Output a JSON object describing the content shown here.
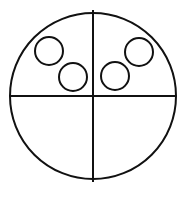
{
  "diagram": {
    "width": 189,
    "height": 199,
    "background": "#ffffff",
    "stroke_color": "#111111",
    "outer_circle": {
      "cx": 93,
      "cy": 96,
      "r": 83,
      "stroke_width": 2
    },
    "dividers": {
      "vertical": {
        "x1": 93,
        "y1": 10,
        "x2": 93,
        "y2": 182,
        "stroke_width": 2
      },
      "horizontal": {
        "x1": 10,
        "y1": 96,
        "x2": 176,
        "y2": 96,
        "stroke_width": 2
      }
    },
    "quadrants": [
      {
        "name": "top-left",
        "small_circles": [
          {
            "cx": 49,
            "cy": 51,
            "r": 14
          },
          {
            "cx": 73,
            "cy": 77,
            "r": 14
          }
        ]
      },
      {
        "name": "top-right",
        "small_circles": [
          {
            "cx": 139,
            "cy": 52,
            "r": 14
          },
          {
            "cx": 115,
            "cy": 76,
            "r": 14
          }
        ]
      },
      {
        "name": "bottom-left",
        "small_circles": []
      },
      {
        "name": "bottom-right",
        "small_circles": []
      }
    ],
    "small_circle_stroke_width": 2,
    "small_circle_count": 4
  }
}
